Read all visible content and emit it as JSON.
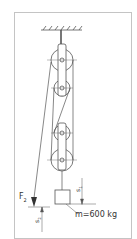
{
  "diagram": {
    "labels": {
      "force": "F",
      "force_sub": "2",
      "s1": "s",
      "s1_sub": "1",
      "s2": "s",
      "s2_sub": "2",
      "mass": "m=600 kg"
    },
    "colors": {
      "line": "#555555",
      "frame": "#bbbbbb",
      "background": "#ffffff"
    },
    "components": [
      "ceiling-support",
      "upper-pulley-block",
      "lower-pulley-block",
      "rope",
      "mass-block",
      "force-arrow",
      "dimension-s1",
      "dimension-s2"
    ]
  }
}
